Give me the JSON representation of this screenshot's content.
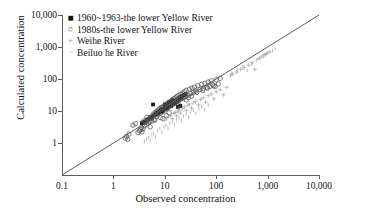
{
  "chart_data": {
    "type": "scatter",
    "title": "",
    "xlabel": "Observed concentration",
    "ylabel": "Calculated concentration",
    "xscale": "log",
    "yscale": "log",
    "xlim": [
      0.1,
      10000
    ],
    "ylim": [
      0.1,
      10000
    ],
    "xticks": [
      "0.1",
      "1",
      "10",
      "100",
      "1,000",
      "10,000"
    ],
    "yticks": [
      "1",
      "10",
      "100",
      "1,000",
      "10,000"
    ],
    "grid": false,
    "legend_position": "top-left",
    "reference_line": {
      "name": "1:1 line",
      "from": [
        0.1,
        0.1
      ],
      "to": [
        10000,
        10000
      ]
    },
    "series": [
      {
        "name": "1960~1963-the lower Yellow River",
        "marker": "filled-square",
        "color": "#1a1a1a",
        "points": [
          [
            3.6,
            4.2
          ],
          [
            4.0,
            4.6
          ],
          [
            4.4,
            5.2
          ],
          [
            4.8,
            5.6
          ],
          [
            5.2,
            6.4
          ],
          [
            5.6,
            6.2
          ],
          [
            5.9,
            16.0
          ],
          [
            6.2,
            7.4
          ],
          [
            6.6,
            7.8
          ],
          [
            7.0,
            8.6
          ],
          [
            7.4,
            9.0
          ],
          [
            7.8,
            9.6
          ],
          [
            8.2,
            10.5
          ],
          [
            8.8,
            11.5
          ],
          [
            9.2,
            11.0
          ],
          [
            9.8,
            12.5
          ],
          [
            10.5,
            13.0
          ],
          [
            11.0,
            14.0
          ],
          [
            11.8,
            15.0
          ],
          [
            12.4,
            15.5
          ],
          [
            13.0,
            16.5
          ],
          [
            13.8,
            17.5
          ],
          [
            14.5,
            18.0
          ],
          [
            15.2,
            19.5
          ],
          [
            16.0,
            20.0
          ],
          [
            16.8,
            21.0
          ],
          [
            17.5,
            22.5
          ],
          [
            18.2,
            23.0
          ],
          [
            19.0,
            25.0
          ],
          [
            19.8,
            26.0
          ],
          [
            20.5,
            27.0
          ],
          [
            21.5,
            28.5
          ],
          [
            22.5,
            30.0
          ],
          [
            12.0,
            19.0
          ],
          [
            14.0,
            22.0
          ],
          [
            10.0,
            16.0
          ],
          [
            18.0,
            13.5
          ],
          [
            20.0,
            14.5
          ],
          [
            24.0,
            32.0
          ],
          [
            25.5,
            34.0
          ],
          [
            8.5,
            9.2
          ],
          [
            9.0,
            10.0
          ],
          [
            6.8,
            8.0
          ],
          [
            7.2,
            8.4
          ],
          [
            11.2,
            12.0
          ],
          [
            13.2,
            14.2
          ],
          [
            15.8,
            17.0
          ],
          [
            17.0,
            19.0
          ]
        ]
      },
      {
        "name": "1980s-the lower Yellow River",
        "marker": "open-circle",
        "color": "#555555",
        "points": [
          [
            1.7,
            1.4
          ],
          [
            1.8,
            1.6
          ],
          [
            1.9,
            1.3
          ],
          [
            2.0,
            1.9
          ],
          [
            2.4,
            3.6
          ],
          [
            2.7,
            4.0
          ],
          [
            3.0,
            2.1
          ],
          [
            3.2,
            2.4
          ],
          [
            3.4,
            2.6
          ],
          [
            3.5,
            3.0
          ],
          [
            3.6,
            2.2
          ],
          [
            3.8,
            2.8
          ],
          [
            4.0,
            3.4
          ],
          [
            4.2,
            4.4
          ],
          [
            4.4,
            3.8
          ],
          [
            4.6,
            5.0
          ],
          [
            4.8,
            4.2
          ],
          [
            5.0,
            5.6
          ],
          [
            5.2,
            3.2
          ],
          [
            5.4,
            6.0
          ],
          [
            5.6,
            4.8
          ],
          [
            5.8,
            7.0
          ],
          [
            6.0,
            8.0
          ],
          [
            6.2,
            5.4
          ],
          [
            6.5,
            9.0
          ],
          [
            6.8,
            6.6
          ],
          [
            7.0,
            10.0
          ],
          [
            7.2,
            7.6
          ],
          [
            7.5,
            11.0
          ],
          [
            7.8,
            8.4
          ],
          [
            8.0,
            12.0
          ],
          [
            8.3,
            6.2
          ],
          [
            8.6,
            13.0
          ],
          [
            9.0,
            9.4
          ],
          [
            9.4,
            14.0
          ],
          [
            9.8,
            10.6
          ],
          [
            10.2,
            15.5
          ],
          [
            10.6,
            11.8
          ],
          [
            11.0,
            17.0
          ],
          [
            11.5,
            12.8
          ],
          [
            12.0,
            18.5
          ],
          [
            12.5,
            14.0
          ],
          [
            13.0,
            20.0
          ],
          [
            13.5,
            15.2
          ],
          [
            14.0,
            22.0
          ],
          [
            14.5,
            16.5
          ],
          [
            15.0,
            24.0
          ],
          [
            15.5,
            17.8
          ],
          [
            16.0,
            26.0
          ],
          [
            16.5,
            19.0
          ],
          [
            17.0,
            28.0
          ],
          [
            17.5,
            20.5
          ],
          [
            18.0,
            30.0
          ],
          [
            19.0,
            22.0
          ],
          [
            20.0,
            33.0
          ],
          [
            21.0,
            24.0
          ],
          [
            22.0,
            36.0
          ],
          [
            23.0,
            26.0
          ],
          [
            24.0,
            40.0
          ],
          [
            25.0,
            28.0
          ],
          [
            26.0,
            44.0
          ],
          [
            28.0,
            31.0
          ],
          [
            30.0,
            48.0
          ],
          [
            32.0,
            35.0
          ],
          [
            34.0,
            52.0
          ],
          [
            36.0,
            38.0
          ],
          [
            38.0,
            56.0
          ],
          [
            40.0,
            42.0
          ],
          [
            44.0,
            62.0
          ],
          [
            48.0,
            46.0
          ],
          [
            52.0,
            68.0
          ],
          [
            56.0,
            50.0
          ],
          [
            60.0,
            74.0
          ],
          [
            65.0,
            55.0
          ],
          [
            70.0,
            80.0
          ],
          [
            75.0,
            58.0
          ],
          [
            80.0,
            88.0
          ],
          [
            90.0,
            62.0
          ],
          [
            100.0,
            95.0
          ],
          [
            110.0,
            70.0
          ],
          [
            120.0,
            105.0
          ],
          [
            9.2,
            5.8
          ],
          [
            10.8,
            7.2
          ],
          [
            12.2,
            8.8
          ],
          [
            5.1,
            4.6
          ],
          [
            6.4,
            5.2
          ],
          [
            4.5,
            6.4
          ],
          [
            3.9,
            4.9
          ],
          [
            26.0,
            22.0
          ],
          [
            29.0,
            26.0
          ],
          [
            33.0,
            29.0
          ],
          [
            42.0,
            38.0
          ],
          [
            55.0,
            44.0
          ],
          [
            68.0,
            52.0
          ],
          [
            85.0,
            66.0
          ],
          [
            95.0,
            58.0
          ],
          [
            18.5,
            16.0
          ]
        ]
      },
      {
        "name": "Weihe River",
        "marker": "plus",
        "color": "#a0a0a0",
        "points": [
          [
            10.0,
            5.2
          ],
          [
            11.0,
            6.0
          ],
          [
            12.0,
            6.8
          ],
          [
            13.0,
            7.4
          ],
          [
            14.0,
            5.8
          ],
          [
            15.0,
            8.4
          ],
          [
            16.0,
            9.0
          ],
          [
            17.0,
            7.0
          ],
          [
            18.0,
            10.0
          ],
          [
            19.0,
            11.0
          ],
          [
            20.0,
            8.6
          ],
          [
            22.0,
            12.0
          ],
          [
            24.0,
            13.5
          ],
          [
            26.0,
            10.5
          ],
          [
            28.0,
            15.0
          ],
          [
            30.0,
            16.5
          ],
          [
            33.0,
            12.5
          ],
          [
            36.0,
            18.0
          ],
          [
            40.0,
            20.0
          ],
          [
            45.0,
            15.5
          ],
          [
            50.0,
            23.0
          ],
          [
            56.0,
            26.0
          ],
          [
            62.0,
            19.0
          ],
          [
            70.0,
            30.0
          ],
          [
            80.0,
            34.0
          ],
          [
            90.0,
            24.0
          ],
          [
            100.0,
            40.0
          ],
          [
            120.0,
            46.0
          ],
          [
            140.0,
            32.0
          ],
          [
            160.0,
            55.0
          ],
          [
            190.0,
            130.0
          ],
          [
            210.0,
            145.0
          ],
          [
            250.0,
            165.0
          ],
          [
            300.0,
            200.0
          ],
          [
            350.0,
            230.0
          ],
          [
            420.0,
            270.0
          ],
          [
            500.0,
            320.0
          ],
          [
            560.0,
            200.0
          ],
          [
            650.0,
            420.0
          ],
          [
            750.0,
            480.0
          ],
          [
            850.0,
            560.0
          ],
          [
            950.0,
            620.0
          ],
          [
            1100.0,
            700.0
          ]
        ]
      },
      {
        "name": "Beiluo he River",
        "marker": "tick",
        "color": "#a8a8a8",
        "points": [
          [
            4.0,
            1.1
          ],
          [
            4.4,
            1.3
          ],
          [
            4.8,
            1.5
          ],
          [
            5.2,
            1.2
          ],
          [
            5.6,
            1.8
          ],
          [
            6.0,
            2.0
          ],
          [
            6.6,
            1.6
          ],
          [
            7.2,
            2.4
          ],
          [
            8.0,
            2.8
          ],
          [
            8.8,
            2.2
          ],
          [
            9.6,
            3.2
          ],
          [
            10.5,
            3.6
          ],
          [
            11.5,
            2.9
          ],
          [
            12.5,
            4.2
          ],
          [
            14.0,
            4.8
          ],
          [
            15.5,
            3.8
          ],
          [
            17.0,
            5.4
          ],
          [
            19.0,
            6.2
          ],
          [
            21.0,
            5.0
          ],
          [
            23.0,
            7.0
          ],
          [
            26.0,
            8.0
          ],
          [
            29.0,
            6.4
          ],
          [
            32.0,
            9.2
          ],
          [
            36.0,
            10.5
          ],
          [
            40.0,
            8.4
          ],
          [
            46.0,
            12.0
          ],
          [
            52.0,
            13.5
          ],
          [
            60.0,
            11.0
          ],
          [
            70.0,
            15.5
          ],
          [
            200.0,
            150.0
          ],
          [
            260.0,
            185.0
          ],
          [
            330.0,
            240.0
          ],
          [
            400.0,
            185.0
          ],
          [
            480.0,
            300.0
          ],
          [
            600.0,
            380.0
          ],
          [
            700.0,
            450.0
          ],
          [
            820.0,
            520.0
          ],
          [
            900.0,
            580.0
          ],
          [
            1000.0,
            640.0
          ],
          [
            1250.0,
            760.0
          ],
          [
            1400.0,
            860.0
          ]
        ]
      }
    ]
  },
  "axes": {
    "y_label": "Calculated concentration",
    "x_label": "Observed concentration"
  }
}
